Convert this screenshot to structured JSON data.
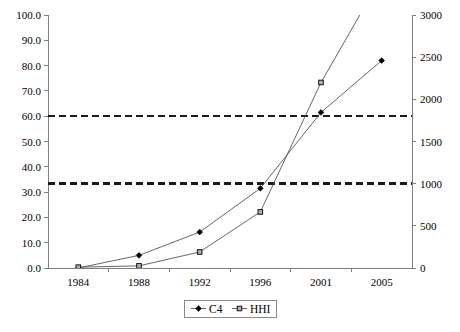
{
  "chart_data": {
    "type": "line",
    "title": "",
    "subtitle": "",
    "xlabel": "",
    "ylabel": "",
    "categories": [
      "1984",
      "1988",
      "1992",
      "1996",
      "2001",
      "2005"
    ],
    "grid": false,
    "legend_position": "bottom-center",
    "axes": {
      "left": {
        "label": "",
        "ylim": [
          0,
          100
        ],
        "tick_step": 10,
        "ticks": [
          "0.0",
          "10.0",
          "20.0",
          "30.0",
          "40.0",
          "50.0",
          "60.0",
          "70.0",
          "80.0",
          "90.0",
          "100.0"
        ],
        "tick_values": [
          0,
          10,
          20,
          30,
          40,
          50,
          60,
          70,
          80,
          90,
          100
        ]
      },
      "right": {
        "label": "",
        "ylim": [
          0,
          3000
        ],
        "tick_step": 500,
        "ticks": [
          "0",
          "500",
          "1000",
          "1500",
          "2000",
          "2500",
          "3000"
        ],
        "tick_values": [
          0,
          500,
          1000,
          1500,
          2000,
          2500,
          3000
        ]
      }
    },
    "series": [
      {
        "name": "C4",
        "axis": "left",
        "marker": "diamond",
        "values": [
          0.0,
          5.0,
          14.2,
          31.5,
          61.5,
          82.0
        ]
      },
      {
        "name": "HHI",
        "axis": "right",
        "marker": "square",
        "clipped_above_axis_max": true,
        "values": [
          10,
          25,
          190,
          665,
          2200,
          3450
        ]
      }
    ],
    "reference_lines": [
      {
        "name": "hhi-1800-threshold",
        "axis": "right",
        "value": 1800,
        "left_axis_equivalent": 60.0,
        "style": "dashed"
      },
      {
        "name": "hhi-1000-threshold",
        "axis": "right",
        "value": 1000,
        "left_axis_equivalent": 33.3,
        "style": "dashed"
      }
    ],
    "legend": [
      {
        "label": "C4",
        "marker": "diamond"
      },
      {
        "label": "HHI",
        "marker": "square"
      }
    ]
  }
}
